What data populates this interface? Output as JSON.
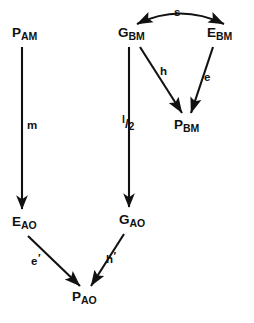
{
  "diagram": {
    "title": "",
    "type": "node-arrow-graph",
    "canvas": {
      "width": 254,
      "height": 323,
      "background": "#ffffff"
    },
    "ink_color": "#111111",
    "nodes": [
      {
        "id": "P_AM",
        "base": "P",
        "sub": "AM",
        "x": 12,
        "y": 26
      },
      {
        "id": "G_BM",
        "base": "G",
        "sub": "BM",
        "x": 118,
        "y": 26
      },
      {
        "id": "E_BM",
        "base": "E",
        "sub": "BM",
        "x": 207,
        "y": 26
      },
      {
        "id": "P_BM",
        "base": "P",
        "sub": "BM",
        "x": 174,
        "y": 118
      },
      {
        "id": "E_AO",
        "base": "E",
        "sub": "AO",
        "x": 12,
        "y": 215
      },
      {
        "id": "G_AO",
        "base": "G",
        "sub": "AO",
        "x": 119,
        "y": 213
      },
      {
        "id": "P_AO",
        "base": "P",
        "sub": "AO",
        "x": 72,
        "y": 290
      }
    ],
    "edges": [
      {
        "id": "edge-s",
        "from": "G_BM",
        "to": "E_BM",
        "label": "s",
        "style": "curved-double-arrow",
        "label_x": 174,
        "label_y": 7
      },
      {
        "id": "edge-m",
        "from": "P_AM",
        "to": "E_AO",
        "label": "m",
        "style": "straight-arrow",
        "label_x": 27,
        "label_y": 120
      },
      {
        "id": "edge-l-half",
        "from": "G_BM",
        "to": "G_AO",
        "label": "l/2",
        "label_numerator": "l",
        "label_slash": "/",
        "label_denominator": "2",
        "style": "straight-arrow",
        "label_x": 122,
        "label_y": 114
      },
      {
        "id": "edge-h",
        "from": "G_BM",
        "to": "P_BM",
        "label": "h",
        "style": "straight-arrow",
        "label_x": 160,
        "label_y": 66
      },
      {
        "id": "edge-e",
        "from": "E_BM",
        "to": "P_BM",
        "label": "e",
        "style": "straight-arrow",
        "label_x": 204,
        "label_y": 72
      },
      {
        "id": "edge-e-prime",
        "from": "E_AO",
        "to": "P_AO",
        "label": "e",
        "prime": "′",
        "style": "straight-arrow",
        "label_x": 31,
        "label_y": 253
      },
      {
        "id": "edge-h-prime",
        "from": "G_AO",
        "to": "P_AO",
        "label": "h",
        "prime": "′",
        "style": "straight-arrow",
        "label_x": 106,
        "label_y": 251
      }
    ]
  }
}
